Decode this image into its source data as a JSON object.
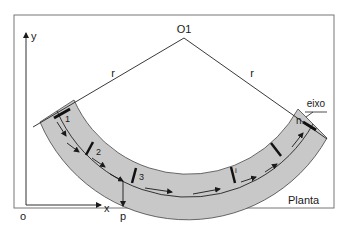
{
  "diagram": {
    "view_label": "Planta",
    "center_label": "O1",
    "radius_labels": [
      "r",
      "r"
    ],
    "axis_label": "eixo",
    "origin_label": "o",
    "x_axis_label": "x",
    "y_axis_label": "y",
    "point_label": "p",
    "section_labels": [
      "1",
      "2",
      "3",
      "i",
      "n"
    ],
    "colors": {
      "band_fill": "#c8c8c8",
      "line": "#1a1a1a",
      "frame": "#666666",
      "background": "#ffffff"
    }
  }
}
